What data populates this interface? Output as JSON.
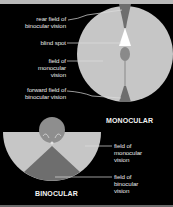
{
  "header": {
    "title_cut_off": ""
  },
  "monocular": {
    "caption": "MONOCULAR",
    "labels": [
      {
        "line1": "rear field of",
        "line2": "binocular vision"
      },
      {
        "line1": "blind spot"
      },
      {
        "line1": "field of",
        "line2": "monocular",
        "line3": "vision"
      },
      {
        "line1": "forward field of",
        "line2": "binocular vision"
      }
    ]
  },
  "binocular": {
    "caption": "BINOCULAR",
    "labels": [
      {
        "line1": "field of",
        "line2": "monocular",
        "line3": "vision"
      },
      {
        "line1": "field of",
        "line2": "binocular",
        "line3": "vision"
      }
    ]
  },
  "colors": {
    "background": "#000000",
    "monocular_field": "#c4c4c4",
    "binocular_field": "#6e6e6e",
    "blind_spot": "#ffffff",
    "head": "#8e8e8e",
    "leader_line": "#d8d8d8"
  }
}
